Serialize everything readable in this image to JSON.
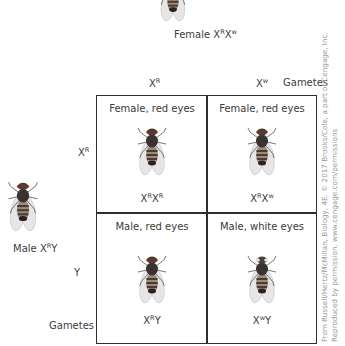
{
  "female_parent": {
    "label_prefix": "Female ",
    "genotype": [
      {
        "base": "X",
        "sup": "R"
      },
      {
        "base": "X",
        "sup": "w"
      }
    ]
  },
  "male_parent": {
    "label_prefix": "Male ",
    "genotype": [
      {
        "base": "X",
        "sup": "R"
      },
      {
        "base": "Y",
        "sup": ""
      }
    ]
  },
  "column_gametes": [
    {
      "base": "X",
      "sup": "R"
    },
    {
      "base": "X",
      "sup": "w"
    }
  ],
  "column_gametes_label": "Gametes",
  "row_gametes": [
    {
      "base": "X",
      "sup": "R"
    },
    {
      "base": "Y",
      "sup": ""
    }
  ],
  "row_gametes_label": "Gametes",
  "cells": [
    {
      "title": "Female, red eyes",
      "geno": [
        {
          "base": "X",
          "sup": "R"
        },
        {
          "base": "X",
          "sup": "R"
        }
      ],
      "eye_color": "#8a2a1c"
    },
    {
      "title": "Female, red eyes",
      "geno": [
        {
          "base": "X",
          "sup": "R"
        },
        {
          "base": "X",
          "sup": "w"
        }
      ],
      "eye_color": "#8a2a1c"
    },
    {
      "title": "Male, red eyes",
      "geno": [
        {
          "base": "X",
          "sup": "R"
        },
        {
          "base": "Y",
          "sup": ""
        }
      ],
      "eye_color": "#8a2a1c"
    },
    {
      "title": "Male, white eyes",
      "geno": [
        {
          "base": "X",
          "sup": "w"
        },
        {
          "base": "Y",
          "sup": ""
        }
      ],
      "eye_color": "#f2f2f2"
    }
  ],
  "credit": {
    "line1": "From Russell/Hertz/McMillan, Biology, 4E. © 2017 Brooks/Cole, a part of Cengage, Inc.",
    "line2": "Reproduced by permission. www.cengage.com/permissions"
  },
  "colors": {
    "grid_line": "#2e2e2e",
    "text": "#3a3a3a",
    "credit_text": "#9a9a9a"
  }
}
